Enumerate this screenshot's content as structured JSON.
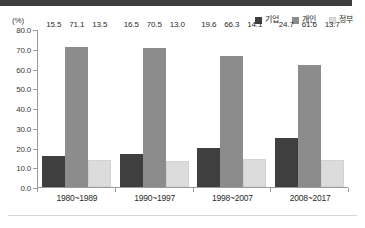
{
  "header": {
    "band_color": "#3d3d3d"
  },
  "axis": {
    "unit_label": "(%)"
  },
  "legend": {
    "items": [
      {
        "label": "기업",
        "color": "#3f3f3f",
        "icon": "square-swatch-icon"
      },
      {
        "label": "개인",
        "color": "#8c8c8c",
        "icon": "square-swatch-icon"
      },
      {
        "label": "정부",
        "color": "#dcdcdc",
        "icon": "square-swatch-icon"
      }
    ]
  },
  "chart_data": {
    "type": "bar",
    "title": "",
    "subtitle": "",
    "xlabel": "",
    "ylabel": "(%)",
    "ylim": [
      0,
      80
    ],
    "ytick_step": 10,
    "grid": false,
    "legend_position": "top-right",
    "categories": [
      "1980~1989",
      "1990~1997",
      "1998~2007",
      "2008~2017"
    ],
    "ytick_labels": [
      "0.0",
      "10.0",
      "20.0",
      "30.0",
      "40.0",
      "50.0",
      "60.0",
      "70.0",
      "80.0"
    ],
    "series": [
      {
        "name": "기업",
        "color": "#3f3f3f",
        "values": [
          15.5,
          16.5,
          19.6,
          24.7
        ],
        "labels": [
          "15.5",
          "16.5",
          "19.6",
          "24.7"
        ]
      },
      {
        "name": "개인",
        "color": "#8c8c8c",
        "values": [
          71.1,
          70.5,
          66.3,
          61.6
        ],
        "labels": [
          "71.1",
          "70.5",
          "66.3",
          "61.6"
        ]
      },
      {
        "name": "정부",
        "color": "#dcdcdc",
        "values": [
          13.5,
          13.0,
          14.1,
          13.7
        ],
        "labels": [
          "13.5",
          "13.0",
          "14.1",
          "13.7"
        ]
      }
    ]
  }
}
